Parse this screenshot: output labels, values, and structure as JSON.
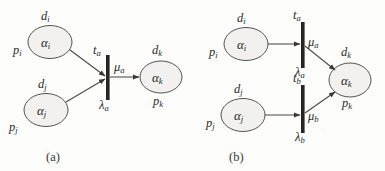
{
  "figure": {
    "background_color": "#fdfdfc",
    "ink_color": "#2b2a28",
    "place_fill_color": "#f2f1ef",
    "place_stroke_color": "#555350",
    "transition_color": "#262523",
    "arc_color": "#4a4845"
  },
  "subfigures": [
    {
      "id": "a",
      "caption": "(a)",
      "places": [
        {
          "id": "p-i",
          "name": "α",
          "name_sub": "i",
          "top_label": "d",
          "top_label_sub": "i",
          "bottom_label": "p",
          "bottom_label_sub": "i"
        },
        {
          "id": "p-j",
          "name": "α",
          "name_sub": "j",
          "top_label": "d",
          "top_label_sub": "j",
          "bottom_label": "p",
          "bottom_label_sub": "j"
        },
        {
          "id": "p-k",
          "name": "α",
          "name_sub": "k",
          "top_label": "d",
          "top_label_sub": "k",
          "bottom_label": "p",
          "bottom_label_sub": "k"
        }
      ],
      "transitions": [
        {
          "id": "t-a",
          "name": "t",
          "name_sub": "a",
          "rate": "λ",
          "rate_sub": "a",
          "out_label": "μ",
          "out_label_sub": "a"
        }
      ]
    },
    {
      "id": "b",
      "caption": "(b)",
      "places": [
        {
          "id": "p-i",
          "name": "α",
          "name_sub": "i",
          "top_label": "d",
          "top_label_sub": "i",
          "bottom_label": "p",
          "bottom_label_sub": "i"
        },
        {
          "id": "p-j",
          "name": "α",
          "name_sub": "j",
          "top_label": "d",
          "top_label_sub": "j",
          "bottom_label": "p",
          "bottom_label_sub": "j"
        },
        {
          "id": "p-k",
          "name": "α",
          "name_sub": "k",
          "top_label": "d",
          "top_label_sub": "k",
          "bottom_label": "p",
          "bottom_label_sub": "k"
        }
      ],
      "transitions": [
        {
          "id": "t-a",
          "name": "t",
          "name_sub": "a",
          "rate": "λ",
          "rate_sub": "a",
          "out_label": "μ",
          "out_label_sub": "a"
        },
        {
          "id": "t-b",
          "name": "t",
          "name_sub": "b",
          "rate": "λ",
          "rate_sub": "b",
          "out_label": "μ",
          "out_label_sub": "b"
        }
      ]
    }
  ]
}
